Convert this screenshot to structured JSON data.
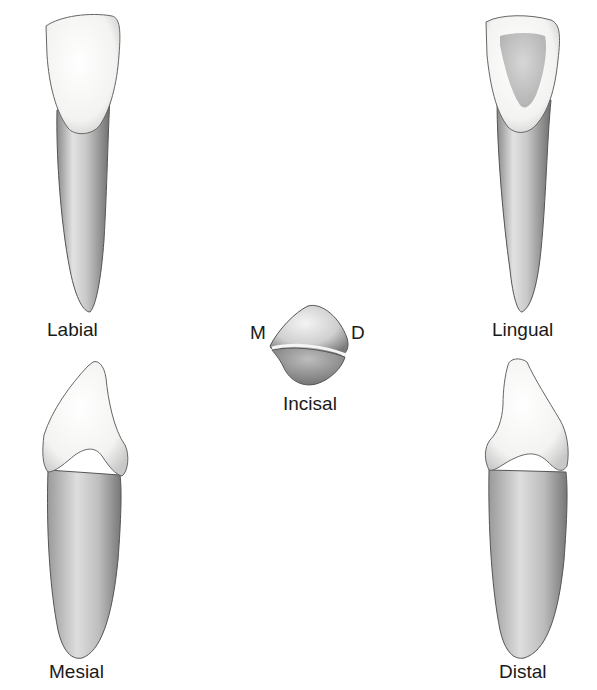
{
  "figure": {
    "views": [
      {
        "id": "labial",
        "label": "Labial"
      },
      {
        "id": "lingual",
        "label": "Lingual"
      },
      {
        "id": "incisal",
        "label": "Incisal"
      },
      {
        "id": "mesial",
        "label": "Mesial"
      },
      {
        "id": "distal",
        "label": "Distal"
      }
    ],
    "incisal_orientation": {
      "left": "M",
      "right": "D"
    }
  },
  "colors": {
    "background": "#ffffff",
    "enamel": "#f7f7f5",
    "root_light": "#e6e6e6",
    "root_dark": "#7d7d7d",
    "outline": "#4a4a4a",
    "text": "#1a1a1a"
  }
}
